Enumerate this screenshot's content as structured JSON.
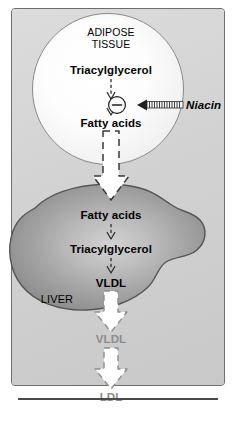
{
  "figure": {
    "panel_background": "#d4d4d4",
    "panel_border": "#6e6e6e",
    "rule_color": "#4a4a4a"
  },
  "adipose": {
    "compartment_line1": "ADIPOSE",
    "compartment_line2": "TISSUE",
    "substrate": "Triacylglycerol",
    "product": "Fatty acids",
    "fill_color": "#ffffff",
    "border_color": "#8a8a8a"
  },
  "inhibition": {
    "symbol": "−",
    "agent": "Niacin",
    "arrow_style": "hatched-inhibitor-arrow",
    "symbol_color": "#000000"
  },
  "liver": {
    "label": "LIVER",
    "substrate": "Fatty acids",
    "intermediate": "Triacylglycerol",
    "product": "VLDL",
    "fill_color": "#9a9a9a",
    "highlight_color": "#c9c9c9",
    "border_color": "#555555"
  },
  "circulation": {
    "vldl": "VLDL",
    "ldl": "LDL",
    "text_color": "#8d8d8d"
  },
  "flow": {
    "big_arrow_fill": "#ffffff",
    "big_arrow_outline": "#3a3a3a",
    "faded_arrow_outline": "#8d8d8d",
    "small_arrow_color": "#3a3a3a"
  }
}
